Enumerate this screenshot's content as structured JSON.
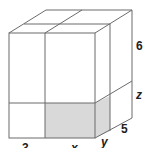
{
  "figure": {
    "type": "rectangular-prism-partitioned",
    "shading_color": "#d9d9d9",
    "line_color": "#6b6b6b",
    "labels": {
      "front_left_width": "3",
      "front_right_width": "x",
      "height_top": "6",
      "height_bottom": "z",
      "depth_back": "5",
      "depth_front": "y"
    }
  }
}
